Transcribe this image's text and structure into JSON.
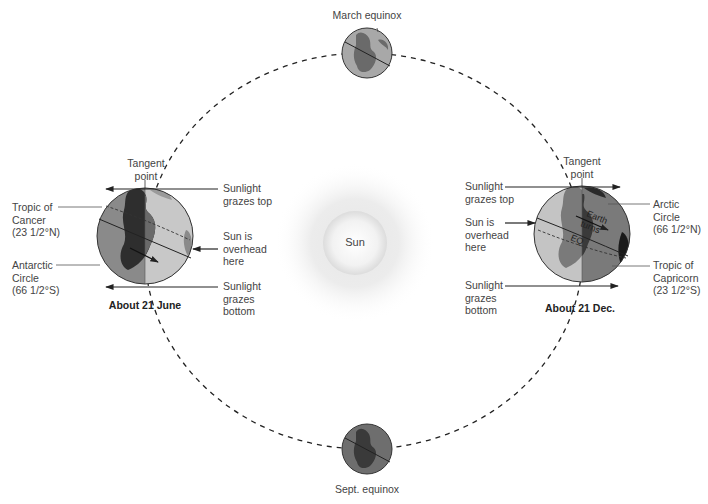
{
  "diagram": {
    "type": "earth-orbit-seasons",
    "sun": {
      "label": "Sun",
      "icon": "sun-glow-icon"
    },
    "orbit": {
      "style": "dashed-ellipse"
    },
    "positions": {
      "march": {
        "label": "March equinox"
      },
      "sept": {
        "label": "Sept. equinox"
      },
      "june": {
        "title": "About 21 June",
        "tangent": "Tangent\npoint",
        "grazes_top": "Sunlight\ngrazes top",
        "overhead": "Sun is\noverhead\nhere",
        "grazes_bottom": "Sunlight\ngrazes\nbottom",
        "tropic": "Tropic of\nCancer\n(23 1/2°N)",
        "circle": "Antarctic\nCircle\n(66 1/2°S)"
      },
      "dec": {
        "title": "About 21 Dec.",
        "tangent": "Tangent\npoint",
        "grazes_top": "Sunlight\ngrazes top",
        "overhead": "Sun is\noverhead\nhere",
        "grazes_bottom": "Sunlight\ngrazes\nbottom",
        "circle": "Arctic\nCircle\n(66 1/2°N)",
        "tropic": "Tropic of\nCapricorn\n(23 1/2°S)",
        "globe_text_1": "Earth",
        "globe_text_2": "turns",
        "globe_text_3": "EQ"
      }
    },
    "colors": {
      "light_side": "#c4c4c4",
      "dark_side": "#8a8a8a",
      "land_light": "#7a7a7a",
      "land_dark": "#3a3a3a",
      "line": "#222222",
      "label": "#444444"
    }
  }
}
